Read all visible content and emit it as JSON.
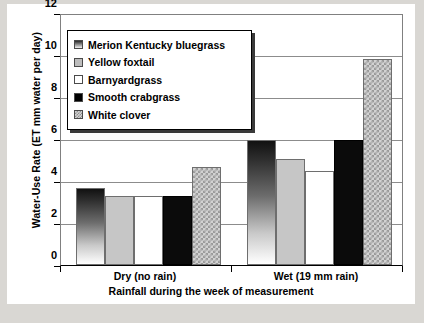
{
  "chart_data": {
    "type": "bar",
    "title": "",
    "xlabel": "Rainfall during the week of measurement",
    "ylabel": "Water-Use Rate  (ET mm water per day)",
    "categories": [
      "Dry (no rain)",
      "Wet (19 mm rain)"
    ],
    "ylim": [
      0,
      12
    ],
    "yticks": [
      0,
      2,
      4,
      6,
      8,
      10,
      12
    ],
    "ytick_labels": [
      "0",
      "2",
      "4",
      "6",
      "8",
      "10",
      "12"
    ],
    "grid": true,
    "legend_position": "upper-left-inside",
    "series": [
      {
        "name": "Merion Kentucky bluegrass",
        "pattern": "gradient-dark-to-white",
        "values": [
          3.7,
          6.0
        ]
      },
      {
        "name": "Yellow foxtail",
        "pattern": "solid-gray",
        "values": [
          3.3,
          5.1
        ]
      },
      {
        "name": "Barnyardgrass",
        "pattern": "white",
        "values": [
          3.3,
          4.5
        ]
      },
      {
        "name": "Smooth crabgrass",
        "pattern": "solid-black",
        "values": [
          3.3,
          6.0
        ]
      },
      {
        "name": "White clover",
        "pattern": "checkered",
        "values": [
          4.7,
          9.9
        ]
      }
    ]
  },
  "legend": {
    "items": [
      {
        "label": "Merion Kentucky bluegrass",
        "swatch": "gradient"
      },
      {
        "label": "Yellow foxtail",
        "swatch": "gray"
      },
      {
        "label": "Barnyardgrass",
        "swatch": "white"
      },
      {
        "label": "Smooth crabgrass",
        "swatch": "black"
      },
      {
        "label": "White clover",
        "swatch": "check"
      }
    ]
  },
  "colors": {
    "gridline": "#8c8c8c",
    "axis": "#000000",
    "plot_background": "#ffffff",
    "page_background": "#d9d7d3",
    "bar_outline": "#6e6e6e"
  }
}
